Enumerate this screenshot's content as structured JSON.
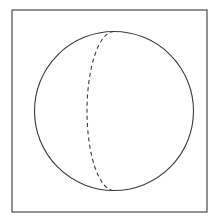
{
  "figure": {
    "title": "Sphere with dashed meridian arc",
    "background_color": "#ffffff",
    "stroke_color": "#3a3a3a",
    "frame": {
      "name": "square-border",
      "x": 12,
      "y": 10,
      "width": 195,
      "height": 202,
      "stroke_width": 1.1,
      "fill": "none"
    },
    "circle": {
      "name": "sphere-outline",
      "cx": 114,
      "cy": 111,
      "r": 79.5,
      "stroke_width": 1.1,
      "fill": "none"
    },
    "meridian": {
      "name": "dashed-meridian-arc",
      "start_x": 114,
      "start_y": 31.5,
      "end_x": 114,
      "end_y": 190.5,
      "rx": 27,
      "ry": 79.5,
      "sweep": 0,
      "large_arc": 0,
      "stroke_width": 1.1,
      "dash_length": 4,
      "dash_gap": 3.2
    }
  }
}
